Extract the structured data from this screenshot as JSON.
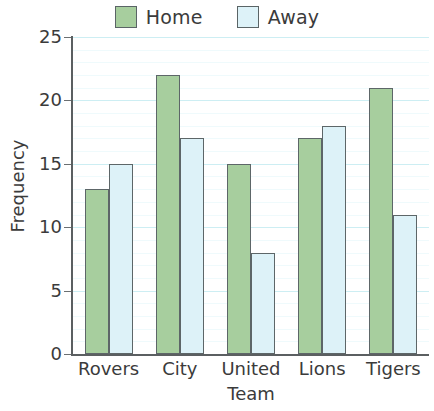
{
  "chart_data": {
    "type": "bar",
    "title": "",
    "xlabel": "Team",
    "ylabel": "Frequency",
    "categories": [
      "Rovers",
      "City",
      "United",
      "Lions",
      "Tigers"
    ],
    "series": [
      {
        "name": "Home",
        "color": "#a7ce9e",
        "values": [
          13,
          22,
          15,
          17,
          21
        ]
      },
      {
        "name": "Away",
        "color": "#ddf2f8",
        "values": [
          15,
          17,
          8,
          18,
          11
        ]
      }
    ],
    "ylim": [
      0,
      25
    ],
    "ytick_labels": [
      "0",
      "5",
      "10",
      "15",
      "20",
      "25"
    ],
    "ytick_values": [
      0,
      5,
      10,
      15,
      20,
      25
    ],
    "minor_tick_step": 1,
    "grid": "horizontal",
    "grid_major_color": "#cdeef3",
    "grid_minor_color": "#effafc",
    "legend_position": "top-center",
    "bar_border_color": "#5d6668",
    "axis_color": "#5b5f61"
  }
}
